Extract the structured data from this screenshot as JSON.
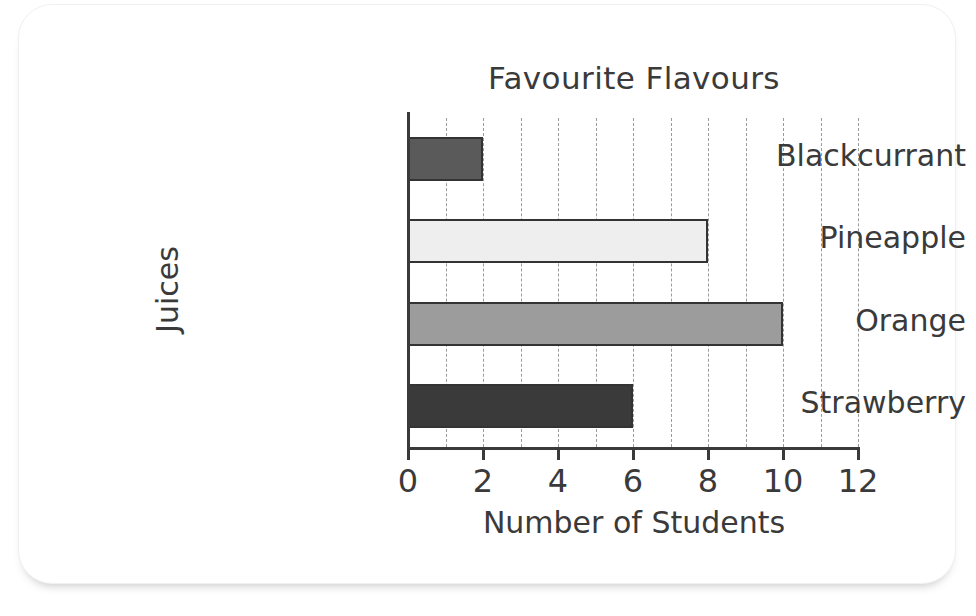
{
  "chart_data": {
    "type": "bar",
    "orientation": "horizontal",
    "title": "Favourite Flavours",
    "xlabel": "Number of Students",
    "ylabel": "Juices",
    "categories": [
      "Blackcurrant",
      "Pineapple",
      "Orange",
      "Strawberry"
    ],
    "values": [
      2,
      8,
      10,
      6
    ],
    "xlim": [
      0,
      12
    ],
    "xticks": [
      0,
      2,
      4,
      6,
      8,
      10,
      12
    ],
    "xtick_labels": [
      "0",
      "2",
      "4",
      "6",
      "8",
      "10",
      "12"
    ],
    "minor_gridlines": [
      1,
      2,
      3,
      4,
      5,
      6,
      7,
      8,
      9,
      10,
      11,
      12
    ],
    "grid": true,
    "legend": "none",
    "bar_colors": [
      "#5a5a5a",
      "#eeeeee",
      "#9c9c9c",
      "#3a3a3a"
    ],
    "bar_edge_color": "#333333",
    "axis_color": "#3a3a3a",
    "grid_color": "#9b9b9b",
    "background": "#ffffff"
  }
}
